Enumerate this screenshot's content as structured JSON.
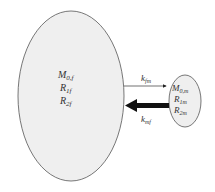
{
  "diagram": {
    "type": "two-compartment exchange model",
    "free_pool": {
      "labels": [
        "M",
        "R",
        "R"
      ],
      "subscripts": [
        "0,f",
        "1f",
        "2f"
      ],
      "fill": "#efefef"
    },
    "macromolecular_pool": {
      "labels": [
        "M",
        "R",
        "R"
      ],
      "subscripts": [
        "0,m",
        "1m",
        "2m"
      ],
      "fill": "#efefef"
    },
    "arrows": [
      {
        "label": "k",
        "subscript": "fm",
        "direction": "free-to-macro",
        "weight": "thin"
      },
      {
        "label": "k",
        "subscript": "mf",
        "direction": "macro-to-free",
        "weight": "thick"
      }
    ]
  }
}
